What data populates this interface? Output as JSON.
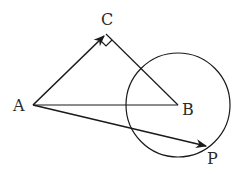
{
  "diagram": {
    "points": [
      {
        "id": "A",
        "label": "A"
      },
      {
        "id": "B",
        "label": "B"
      },
      {
        "id": "C",
        "label": "C"
      },
      {
        "id": "P",
        "label": "P"
      }
    ],
    "segments": [
      "AB",
      "CB"
    ],
    "vectors": [
      "AC",
      "AP"
    ],
    "circle": {
      "center": "B",
      "passes_through": "P"
    },
    "right_angle_at": "C",
    "stroke_color": "#1a1a1a"
  }
}
